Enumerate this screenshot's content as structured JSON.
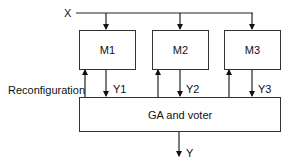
{
  "diagram": {
    "input_label": "X",
    "output_label": "Y",
    "modules": [
      {
        "label": "M1",
        "output": "Y1"
      },
      {
        "label": "M2",
        "output": "Y2"
      },
      {
        "label": "M3",
        "output": "Y3"
      }
    ],
    "voter_label": "GA and voter",
    "feedback_label": "Reconfiguration"
  }
}
